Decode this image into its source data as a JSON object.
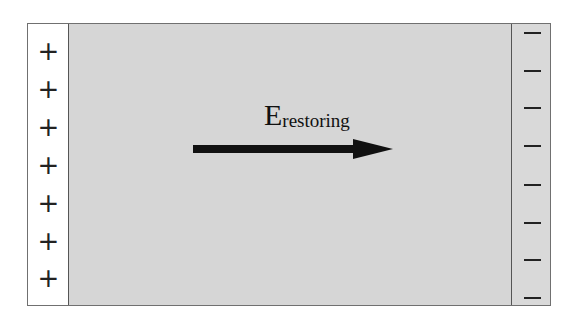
{
  "diagram": {
    "field_label": {
      "main": "E",
      "subscript": "restoring"
    },
    "left_plate": {
      "sign": "+",
      "count": 7
    },
    "right_plate": {
      "sign": "−",
      "count": 8
    },
    "arrow": {
      "direction": "right",
      "color": "#111111"
    },
    "colors": {
      "field_region": "#d6d6d6",
      "left_plate": "#ffffff",
      "right_plate": "#d9d9d9"
    }
  }
}
